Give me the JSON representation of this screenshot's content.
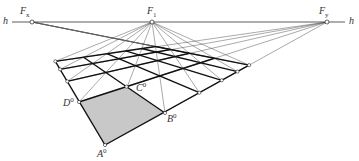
{
  "diagram": {
    "type": "perspective-grid-construction",
    "horizon": {
      "label": "h",
      "y": 22,
      "x_start": 12,
      "x_end": 345
    },
    "vanishing_points": [
      {
        "id": "Fx",
        "label": "F",
        "sub": "x",
        "x": 32,
        "y": 22
      },
      {
        "id": "F1",
        "label": "F",
        "sub": "1",
        "x": 152,
        "y": 22
      },
      {
        "id": "Fy",
        "label": "F",
        "sub": "y",
        "x": 327,
        "y": 22
      }
    ],
    "square": {
      "A": {
        "label": "A",
        "sup": "0",
        "x": 105,
        "y": 145
      },
      "B": {
        "label": "B",
        "sup": "0",
        "x": 165,
        "y": 113
      },
      "C": {
        "label": "C",
        "sup": "0",
        "x": 127,
        "y": 88
      },
      "D": {
        "label": "D",
        "sup": "0",
        "x": 79,
        "y": 102
      },
      "fill": "#c8c8c8"
    },
    "grid": {
      "cols": 5,
      "rows": 4
    },
    "colors": {
      "thick": "#111111",
      "thin": "#555555",
      "node_fill": "#ffffff"
    }
  }
}
